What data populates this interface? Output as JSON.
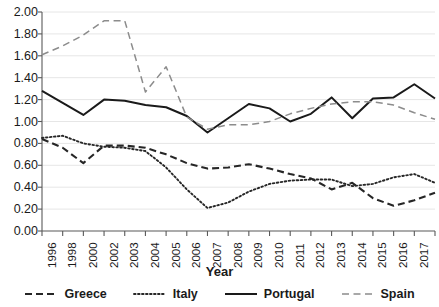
{
  "chart_data": {
    "type": "line",
    "title": "",
    "xlabel": "Year",
    "ylabel": "",
    "ylim": [
      0.0,
      2.0
    ],
    "ytick_step": 0.2,
    "grid": true,
    "legend_position": "bottom",
    "categories": [
      "1996",
      "1998",
      "2000",
      "2002",
      "2003",
      "2004",
      "2005",
      "2006",
      "2007",
      "2008",
      "2009",
      "2010",
      "2011",
      "2012",
      "2013",
      "2014",
      "2015",
      "2016",
      "2017",
      "2018"
    ],
    "yticks": [
      "0.00",
      "0.20",
      "0.40",
      "0.60",
      "0.80",
      "1.00",
      "1.20",
      "1.40",
      "1.60",
      "1.80",
      "2.00"
    ],
    "series": [
      {
        "name": "Greece",
        "style": "dashed",
        "color": "#262626",
        "values": [
          0.84,
          0.76,
          0.62,
          0.78,
          0.78,
          0.76,
          0.7,
          0.62,
          0.57,
          0.58,
          0.61,
          0.57,
          0.52,
          0.48,
          0.38,
          0.44,
          0.3,
          0.23,
          0.28,
          0.35
        ]
      },
      {
        "name": "Italy",
        "style": "dotted",
        "color": "#262626",
        "values": [
          0.85,
          0.87,
          0.8,
          0.77,
          0.76,
          0.73,
          0.58,
          0.38,
          0.21,
          0.26,
          0.36,
          0.43,
          0.46,
          0.47,
          0.47,
          0.41,
          0.43,
          0.49,
          0.52,
          0.44
        ]
      },
      {
        "name": "Portugal",
        "style": "solid",
        "color": "#1a1a1a",
        "values": [
          1.28,
          1.17,
          1.06,
          1.2,
          1.19,
          1.15,
          1.13,
          1.05,
          0.9,
          1.03,
          1.16,
          1.12,
          1.0,
          1.07,
          1.22,
          1.03,
          1.21,
          1.22,
          1.34,
          1.21
        ]
      },
      {
        "name": "Spain",
        "style": "dashed-gray",
        "color": "#8c8c8c",
        "values": [
          1.61,
          1.69,
          1.79,
          1.92,
          1.92,
          1.27,
          1.5,
          1.04,
          0.93,
          0.97,
          0.97,
          1.0,
          1.07,
          1.12,
          1.16,
          1.18,
          1.18,
          1.15,
          1.08,
          1.02
        ]
      }
    ]
  },
  "legend": {
    "items": [
      {
        "label": "Greece"
      },
      {
        "label": "Italy"
      },
      {
        "label": "Portugal"
      },
      {
        "label": "Spain"
      }
    ]
  }
}
